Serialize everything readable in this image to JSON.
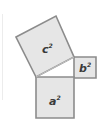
{
  "diagram": {
    "squares": [
      {
        "id": "c",
        "label": "c",
        "exponent": "2",
        "points": "16,37 56,16 74,57 36,77",
        "label_x": 42,
        "label_y": 52
      },
      {
        "id": "b",
        "label": "b",
        "exponent": "2",
        "points": "74,57 96,57 96,78 74,78",
        "label_x": 80,
        "label_y": 72
      },
      {
        "id": "a",
        "label": "a",
        "exponent": "2",
        "points": "36,77 74,77 74,118 36,118",
        "label_x": 49,
        "label_y": 104
      }
    ],
    "colors": {
      "fill": "#e6e6e6",
      "stroke": "#8c8c8c",
      "text": "#3a3a3a",
      "background": "#ffffff"
    }
  }
}
